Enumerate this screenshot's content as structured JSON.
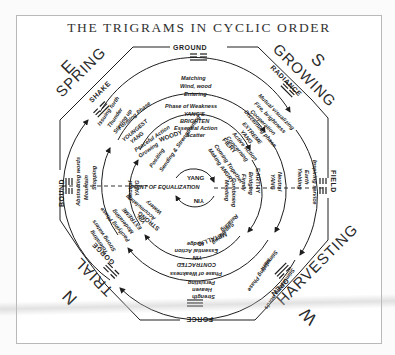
{
  "title": "THE TRIGRAMS IN CYCLIC ORDER",
  "colors": {
    "ink": "#1e1e1e",
    "frame": "#b9b9b9",
    "paper": "#ffffff"
  },
  "seasons": [
    {
      "direction": "S",
      "season": "GROWING"
    },
    {
      "direction": "W",
      "season": "HARVESTING"
    },
    {
      "direction": "N",
      "season": "TRIAL"
    },
    {
      "direction": "E",
      "season": "SPRING"
    }
  ],
  "trigrams": {
    "ground": "GROUND",
    "radiance": "RADIANCE",
    "field": "FIELD",
    "open": "OPEN",
    "force": "FORCE",
    "gorge": "GORGE",
    "bound": "BOUND",
    "shake": "SHAKE"
  },
  "outer_ring": {
    "top": [
      "Matching",
      "Wind, wood",
      "Entering"
    ],
    "top_right": [
      "Mutual visualizing",
      "Fire, brightness",
      "Cooperation"
    ],
    "right": [
      "Inspiring service",
      "Earth",
      "Yielding"
    ],
    "bottom_right": [
      "Stimulating words"
    ],
    "bottom": [
      "Strength",
      "Heaven",
      "Persisting"
    ],
    "bottom_left": [
      "Tolerating",
      "Strong waters"
    ],
    "left": [
      "Abstracting words",
      "Mountain",
      "Stopping"
    ],
    "top_left": [
      "Issuing forth",
      "Thunder",
      "Stirring up"
    ]
  },
  "middle_ring": {
    "top": [
      "Phase of Weakness",
      "YANG'S",
      "BRIGHTEN",
      "Essential Action",
      "Scatter"
    ],
    "top_right": [
      "Discerning phase",
      "EXTREME",
      "YANG",
      "Active Action",
      "Concerning"
    ],
    "right": [
      "Neutral",
      "YANG",
      "Earthy"
    ],
    "bottom_right": [
      "Merit",
      "Stimulating Phase"
    ],
    "bottom": [
      "Phase of Weakness",
      "CONTRACTED",
      "YIN",
      "Essential Action",
      "Hedge"
    ],
    "bottom_left": [
      "Pacifying Phase",
      "Moderating",
      "EXTREME",
      "YIN"
    ],
    "left": [
      "Neutral",
      "YANG"
    ],
    "top_left": [
      "Forming Phase",
      "YOUNGEST",
      "YANG"
    ]
  },
  "inner_ring": {
    "top_left": [
      "Peaceful Action",
      "Growing",
      "WOODY"
    ],
    "left_upper": [
      "Positing"
    ],
    "left_mid": [
      "Sending & Strengthening"
    ],
    "top_right": [
      "FIERY",
      "Coming Together",
      "Making ANGRY"
    ],
    "right": [
      "EARTHY",
      "Bridging",
      "Firmly"
    ],
    "right_low": [
      "Combining",
      "Meeting"
    ],
    "bottom": [
      "METALLIC",
      "Separating",
      "Relating"
    ],
    "bottom_left": [
      "STRONG",
      "Accumulating",
      "Watery"
    ]
  },
  "center": {
    "yang": "YANG",
    "yin": "YIN",
    "equalization": "POINT OF EQUALIZATION"
  }
}
